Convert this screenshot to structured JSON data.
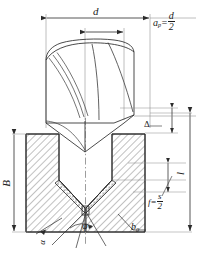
{
  "figure": {
    "title_fragment": "",
    "caption_fragment": "",
    "domain": "engineering-drawing"
  },
  "labels": {
    "diameter": "d",
    "depth_of_cut_symbol": "a",
    "depth_of_cut_sub": "p",
    "depth_of_cut_eq": "=",
    "depth_of_cut_num": "d",
    "depth_of_cut_den": "2",
    "delta": "Δ",
    "width_B": "B",
    "length_l": "l",
    "feed_symbol": "f",
    "feed_eq": "=",
    "feed_num": "s",
    "feed_den": "2",
    "angle_phi": "φ",
    "angle_small": "α",
    "groove_width": "b",
    "groove_width_sub": "0"
  },
  "colors": {
    "line": "#2b2b2b",
    "thin_line": "#5a5a5a",
    "hatch": "#555555",
    "stipple": "#6a6a6a",
    "paper": "#ffffff"
  }
}
